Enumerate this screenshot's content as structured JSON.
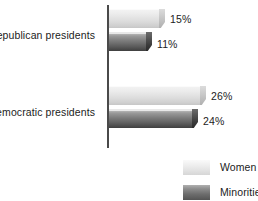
{
  "chart_data": {
    "type": "bar",
    "orientation": "horizontal",
    "title": "",
    "subtitle": "",
    "xlabel": "",
    "ylabel": "",
    "grid": false,
    "xlim": [
      0,
      30
    ],
    "axis_line": "vertical baseline at zero",
    "legend_position": "bottom-right",
    "categories": [
      "Republican presidents",
      "Democratic presidents"
    ],
    "series": [
      {
        "name": "Women",
        "values": [
          15,
          26
        ],
        "labels": [
          "15%",
          "26%"
        ],
        "color": "#e2e2e2"
      },
      {
        "name": "Minorities",
        "values": [
          11,
          24
        ],
        "labels": [
          "11%",
          "24%"
        ],
        "color": "#5d5d5d"
      }
    ],
    "bars": [
      {
        "category": "Republican presidents",
        "series": "Women",
        "value": 15,
        "label": "15%",
        "width_px": 56,
        "label_x_px": 170
      },
      {
        "category": "Republican presidents",
        "series": "Minorities",
        "value": 11,
        "label": "11%",
        "width_px": 43,
        "label_x_px": 157
      },
      {
        "category": "Democratic presidents",
        "series": "Women",
        "value": 26,
        "label": "26%",
        "width_px": 97,
        "label_x_px": 211
      },
      {
        "category": "Democratic presidents",
        "series": "Minorities",
        "value": 24,
        "label": "24%",
        "width_px": 89,
        "label_x_px": 203
      }
    ]
  },
  "legend": {
    "items": [
      {
        "label": "Women",
        "swatch": "light-gray-swatch"
      },
      {
        "label": "Minorities",
        "swatch": "dark-gray-swatch"
      }
    ]
  },
  "colors": {
    "axis": "#4a4a4a",
    "text": "#1c1c1c",
    "background": "#ffffff",
    "women": "#e2e2e2",
    "minorities": "#5d5d5d"
  }
}
